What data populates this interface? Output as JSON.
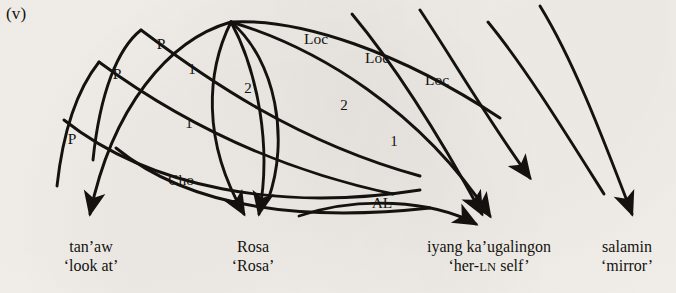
{
  "figure": {
    "example_number": "(v)",
    "language_note": "",
    "background_color": "#f4f1ec",
    "ink_color": "#14120f"
  },
  "words": [
    {
      "id": "word-tanaw",
      "form": "tan’aw",
      "gloss": "‘look at’",
      "x": 91,
      "y": 246
    },
    {
      "id": "word-rosa",
      "form": "Rosa",
      "gloss": "‘Rosa’",
      "x": 253,
      "y": 246
    },
    {
      "id": "word-iyang-kaugalingon",
      "form": "iyang ka’ugalingon",
      "gloss_pre": "‘her-",
      "gloss_smallcaps": "LN",
      "gloss_post": " self’",
      "gloss": "‘her-LN self’",
      "x": 489,
      "y": 246
    },
    {
      "id": "word-salamin",
      "form": "salamin",
      "gloss": "‘mirror’",
      "x": 627,
      "y": 246
    }
  ],
  "arc_labels": [
    {
      "id": "label-p-1",
      "text": "P",
      "x": 161,
      "y": 44,
      "kind": "relation"
    },
    {
      "id": "label-p-2",
      "text": "P",
      "x": 117,
      "y": 74,
      "kind": "relation"
    },
    {
      "id": "label-p-3",
      "text": "P",
      "x": 72,
      "y": 139,
      "kind": "relation"
    },
    {
      "id": "label-loc-1",
      "text": "Loc",
      "x": 316,
      "y": 39,
      "kind": "relation"
    },
    {
      "id": "label-loc-2",
      "text": "Loc",
      "x": 377,
      "y": 58,
      "kind": "relation"
    },
    {
      "id": "label-loc-3",
      "text": "Loc",
      "x": 437,
      "y": 80,
      "kind": "relation"
    },
    {
      "id": "label-num-1",
      "text": "1",
      "x": 192,
      "y": 69,
      "kind": "numeral"
    },
    {
      "id": "label-num-2",
      "text": "2",
      "x": 248,
      "y": 88,
      "kind": "numeral"
    },
    {
      "id": "label-num-3",
      "text": "1",
      "x": 189,
      "y": 123,
      "kind": "numeral"
    },
    {
      "id": "label-num-4",
      "text": "2",
      "x": 344,
      "y": 105,
      "kind": "numeral"
    },
    {
      "id": "label-num-5",
      "text": "1",
      "x": 394,
      "y": 141,
      "kind": "numeral"
    },
    {
      "id": "label-cho",
      "text": "Cho",
      "x": 181,
      "y": 180,
      "kind": "relation"
    },
    {
      "id": "label-al",
      "text": "AL",
      "x": 382,
      "y": 203,
      "kind": "relation"
    }
  ],
  "arcs": [
    {
      "id": "arc-p-1",
      "label": "P",
      "from": "apex",
      "to": "word-tanaw",
      "arrow": true
    },
    {
      "id": "arc-p-2",
      "label": "P",
      "from": "offtop",
      "to": "word-tanaw",
      "arrow": false
    },
    {
      "id": "arc-p-3",
      "label": "P",
      "from": "offtop",
      "to": "word-tanaw",
      "arrow": false
    },
    {
      "id": "arc-num-1",
      "label": "1",
      "from": "apex",
      "to": "word-rosa",
      "arrow": true
    },
    {
      "id": "arc-num-2",
      "label": "2",
      "from": "apex",
      "to": "word-rosa",
      "arrow": true
    },
    {
      "id": "arc-cho",
      "label": "Cho",
      "from": "apex",
      "to": "word-rosa",
      "arrow": true
    },
    {
      "id": "arc-loc-1",
      "label": "Loc",
      "from": "apex",
      "to": "word-iyang-kaugalingon",
      "arrow": true
    },
    {
      "id": "arc-loc-2",
      "label": "Loc",
      "from": "offtop",
      "to": "word-iyang-kaugalingon",
      "arrow": true
    },
    {
      "id": "arc-loc-3",
      "label": "Loc",
      "from": "offtop",
      "to": "word-salamin",
      "arrow": true
    },
    {
      "id": "arc-al",
      "label": "AL",
      "from": "word-rosa",
      "to": "word-iyang-kaugalingon",
      "arrow": true
    }
  ]
}
